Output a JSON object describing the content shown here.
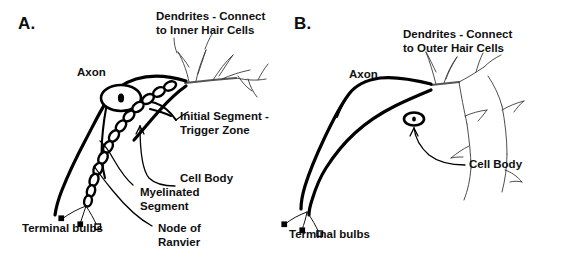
{
  "figure": {
    "background_color": "#ffffff",
    "ink_color": "#000000",
    "dendrite_color": "#3a3a3a",
    "width": 561,
    "height": 262
  },
  "panels": [
    {
      "id": "A",
      "letter": "A.",
      "labels": {
        "dendrites": "Dendrites - Connect\nto Inner Hair Cells",
        "axon": "Axon",
        "initial_segment": "Initial Segment -\nTrigger Zone",
        "cell_body": "Cell Body",
        "myelinated_segment": "Myelinated\nSegment",
        "node_of_ranvier": "Node of\nRanvier",
        "terminal_bulbs": "Terminal bulbs"
      }
    },
    {
      "id": "B",
      "letter": "B.",
      "labels": {
        "dendrites": "Dendrites - Connect\nto Outer Hair Cells",
        "axon": "Axon",
        "cell_body": "Cell Body",
        "terminal_bulbs": "Terminal bulbs"
      }
    }
  ]
}
